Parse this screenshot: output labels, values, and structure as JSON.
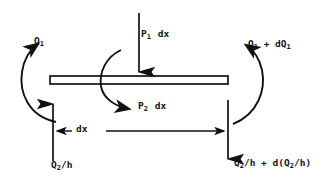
{
  "figure": {
    "type": "free-body-diagram",
    "title": "",
    "background_color": "#ffffff",
    "stroke_color": "#111111"
  },
  "labels": {
    "moment_left": "Q1",
    "moment_left_base": "Q",
    "moment_left_sub": "1",
    "load_top": "P1 dx",
    "load_top_base": "P",
    "load_top_sub": "1",
    "load_top_tail": "dx",
    "moment_right_base": "Q",
    "moment_right_sub": "1",
    "moment_right_mid": " + d",
    "moment_right_base2": "Q",
    "moment_right_sub2": "1",
    "load_bottom_base": "P",
    "load_bottom_sub": "2",
    "load_bottom_tail": "dx",
    "dimension": "dx",
    "shear_left_base": "Q",
    "shear_left_sub": "2",
    "shear_left_tail": "/h",
    "shear_right_base": "Q",
    "shear_right_sub": "2",
    "shear_right_tail": "/h + d(",
    "shear_right_base2": "Q",
    "shear_right_sub2": "2",
    "shear_right_tail2": "/h)"
  },
  "elements": {
    "beam": {
      "name": "beam-element",
      "x1": 50,
      "x2": 228,
      "y_top": 76,
      "y_bottom": 84
    },
    "arrow_top": {
      "name": "p1-load-arrow",
      "direction": "down",
      "x": 139,
      "y_start": 13,
      "y_end": 76
    },
    "arrow_left_shear": {
      "name": "q2h-shear-arrow-left",
      "direction": "up",
      "x": 53,
      "y_start": 161,
      "y_end": 100
    },
    "arrow_right_shear": {
      "name": "q2h-shear-arrow-right",
      "direction": "down",
      "x": 228,
      "y_start": 100,
      "y_end": 163
    },
    "arc_left": {
      "name": "q1-moment-arc-left",
      "rotation": "counterclockwise"
    },
    "arc_right": {
      "name": "q1-dq1-moment-arc-right",
      "rotation": "counterclockwise"
    },
    "arc_center": {
      "name": "p2-load-arc-center",
      "rotation": "clockwise"
    },
    "dimension_line": {
      "name": "dx-dimension-line",
      "x1": 53,
      "x2": 228,
      "y": 131
    }
  }
}
